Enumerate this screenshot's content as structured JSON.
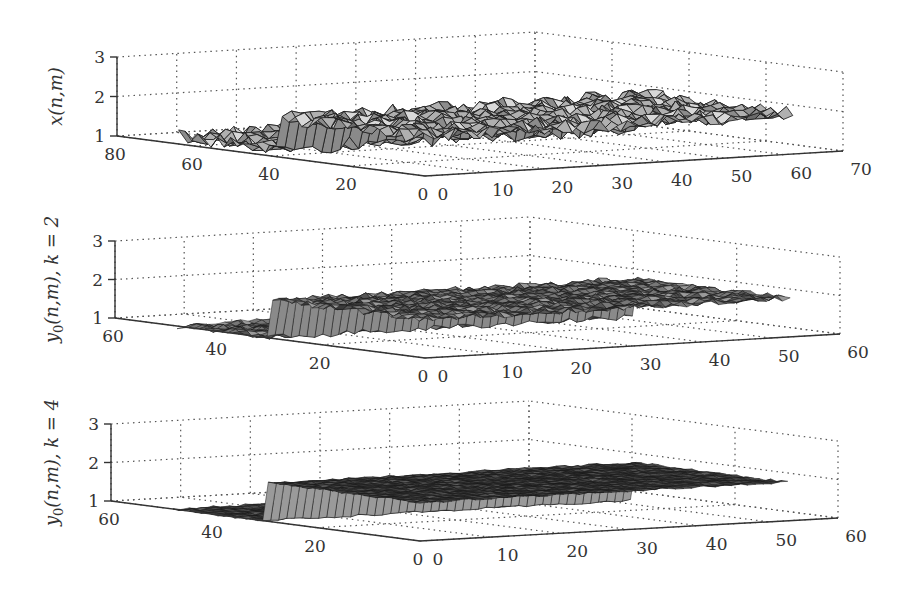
{
  "figure": {
    "panels": [
      {
        "id": "panel-1",
        "zlabel": "x(n,m)",
        "zticks": [
          "1",
          "2",
          "3"
        ],
        "left_axis_ticks": [
          "80",
          "60",
          "40",
          "20",
          "0"
        ],
        "right_axis_ticks": [
          "0",
          "10",
          "20",
          "30",
          "40",
          "50",
          "60",
          "70"
        ]
      },
      {
        "id": "panel-2",
        "zlabel": "y0(n,m), k = 2",
        "zticks": [
          "1",
          "2",
          "3"
        ],
        "left_axis_ticks": [
          "60",
          "40",
          "20",
          "0"
        ],
        "right_axis_ticks": [
          "0",
          "10",
          "20",
          "30",
          "40",
          "50",
          "60"
        ]
      },
      {
        "id": "panel-3",
        "zlabel": "y0(n,m), k = 4",
        "zticks": [
          "1",
          "2",
          "3"
        ],
        "left_axis_ticks": [
          "60",
          "40",
          "20",
          "0"
        ],
        "right_axis_ticks": [
          "0",
          "10",
          "20",
          "30",
          "40",
          "50",
          "60"
        ]
      }
    ]
  },
  "chart_data": [
    {
      "type": "surface",
      "title": "",
      "zlabel": "x(n,m)",
      "axis_n": {
        "ticks": [
          0,
          20,
          40,
          60,
          80
        ],
        "range": [
          0,
          80
        ]
      },
      "axis_m": {
        "ticks": [
          0,
          10,
          20,
          30,
          40,
          50,
          60,
          70
        ],
        "range": [
          0,
          70
        ]
      },
      "zlim": [
        1,
        3
      ],
      "zticks": [
        1,
        2,
        3
      ],
      "grid": true,
      "description": "Noisy piecewise-constant surface: base level ~1.2 with noise, a raised rectangular step to ~2 for m in roughly [0,28] and n in [0,~40], a narrow spike near n~15, m~0; noisy plateau continues to m~62",
      "levels": {
        "low": 1.2,
        "high": 2.0,
        "noise_amplitude": 0.2
      },
      "step_region": {
        "m": [
          0,
          28
        ],
        "n": [
          0,
          38
        ]
      }
    },
    {
      "type": "surface",
      "title": "",
      "zlabel": "y0(n,m), k = 2",
      "axis_n": {
        "ticks": [
          0,
          20,
          40,
          60
        ],
        "range": [
          0,
          60
        ]
      },
      "axis_m": {
        "ticks": [
          0,
          10,
          20,
          30,
          40,
          50,
          60
        ],
        "range": [
          0,
          60
        ]
      },
      "zlim": [
        1,
        3
      ],
      "zticks": [
        1,
        2,
        3
      ],
      "grid": true,
      "description": "Filtered surface after k=2 iterations: reduced noise, step edge ~1 to ~2 preserved, small spike remains near n~15",
      "levels": {
        "low": 1.0,
        "high": 2.0,
        "noise_amplitude": 0.08
      },
      "step_region": {
        "m": [
          0,
          28
        ],
        "n": [
          0,
          30
        ]
      }
    },
    {
      "type": "surface",
      "title": "",
      "zlabel": "y0(n,m), k = 4",
      "axis_n": {
        "ticks": [
          0,
          20,
          40,
          60
        ],
        "range": [
          0,
          60
        ]
      },
      "axis_m": {
        "ticks": [
          0,
          10,
          20,
          30,
          40,
          50,
          60
        ],
        "range": [
          0,
          60
        ]
      },
      "zlim": [
        1,
        3
      ],
      "zticks": [
        1,
        2,
        3
      ],
      "grid": true,
      "description": "Filtered surface after k=4 iterations: smooth, spike removed, clean step from ~1 to ~2",
      "levels": {
        "low": 1.0,
        "high": 2.0,
        "noise_amplitude": 0.03
      },
      "step_region": {
        "m": [
          0,
          28
        ],
        "n": [
          0,
          30
        ]
      }
    }
  ]
}
